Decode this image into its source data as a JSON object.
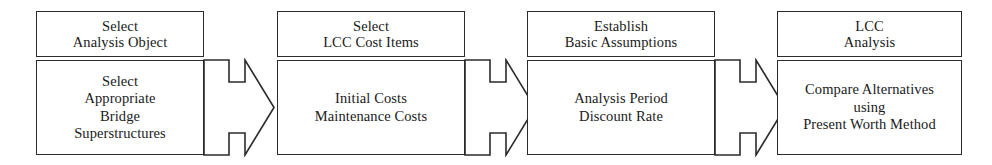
{
  "diagram": {
    "orientation": "horizontal-left-to-right",
    "stroke_color": "#2b2b2b",
    "fill_color": "#ffffff",
    "stages": [
      {
        "id": "select-analysis-object",
        "header_lines": [
          "Select",
          "Analysis Object"
        ],
        "body_lines": [
          "Select",
          "Appropriate",
          "Bridge",
          "Superstructures"
        ],
        "has_arrow": true
      },
      {
        "id": "select-lcc-cost-items",
        "header_lines": [
          "Select",
          "LCC Cost Items"
        ],
        "body_lines": [
          "Initial Costs",
          "Maintenance Costs"
        ],
        "has_arrow": true
      },
      {
        "id": "establish-basic-assumptions",
        "header_lines": [
          "Establish",
          "Basic Assumptions"
        ],
        "body_lines": [
          "Analysis Period",
          "Discount Rate"
        ],
        "has_arrow": true
      },
      {
        "id": "lcc-analysis",
        "header_lines": [
          "LCC",
          "Analysis"
        ],
        "body_lines": [
          "Compare Alternatives",
          "using",
          "Present Worth Method"
        ],
        "has_arrow": false
      }
    ],
    "arrows": [
      {
        "id": "arrow-1",
        "from": "select-analysis-object",
        "to": "select-lcc-cost-items",
        "icon": "right-arrow-icon"
      },
      {
        "id": "arrow-2",
        "from": "select-lcc-cost-items",
        "to": "establish-basic-assumptions",
        "icon": "right-arrow-icon"
      },
      {
        "id": "arrow-3",
        "from": "establish-basic-assumptions",
        "to": "lcc-analysis",
        "icon": "right-arrow-icon"
      }
    ]
  }
}
